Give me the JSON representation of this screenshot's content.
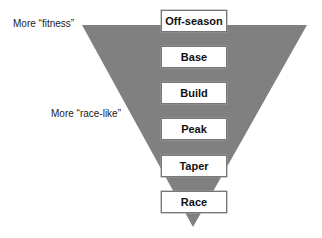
{
  "labels": {
    "top": "More “fitness”",
    "middle": "More “race-like”"
  },
  "phases": [
    "Off-season",
    "Base",
    "Build",
    "Peak",
    "Taper",
    "Race"
  ],
  "colors": {
    "triangle": "#7f7f7f",
    "box_fill": "#ffffff",
    "box_border": "#777777"
  }
}
